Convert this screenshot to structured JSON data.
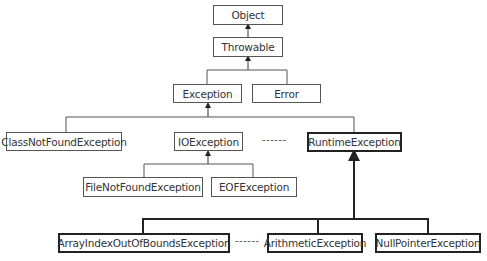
{
  "diagram": {
    "type": "class-hierarchy",
    "nodes": {
      "object": "Object",
      "throwable": "Throwable",
      "exception": "Exception",
      "error": "Error",
      "class_not_found": "ClassNotFoundException",
      "io_exception": "IOException",
      "runtime_exception": "RuntimeException",
      "file_not_found": "FileNotFoundException",
      "eof_exception": "EOFException",
      "array_index": "ArrayIndexOutOfBoundsException",
      "arithmetic": "ArithmeticException",
      "null_pointer": "NullPointerException"
    },
    "ellipsis": "------",
    "edges": [
      {
        "from": "Throwable",
        "to": "Object"
      },
      {
        "from": "Exception",
        "to": "Throwable"
      },
      {
        "from": "Error",
        "to": "Throwable"
      },
      {
        "from": "ClassNotFoundException",
        "to": "Exception"
      },
      {
        "from": "IOException",
        "to": "Exception"
      },
      {
        "from": "RuntimeException",
        "to": "Exception"
      },
      {
        "from": "FileNotFoundException",
        "to": "IOException"
      },
      {
        "from": "EOFException",
        "to": "IOException"
      },
      {
        "from": "ArrayIndexOutOfBoundsException",
        "to": "RuntimeException"
      },
      {
        "from": "ArithmeticException",
        "to": "RuntimeException"
      },
      {
        "from": "NullPointerException",
        "to": "RuntimeException"
      }
    ],
    "highlighted": [
      "RuntimeException",
      "ArrayIndexOutOfBoundsException",
      "ArithmeticException",
      "NullPointerException"
    ]
  }
}
